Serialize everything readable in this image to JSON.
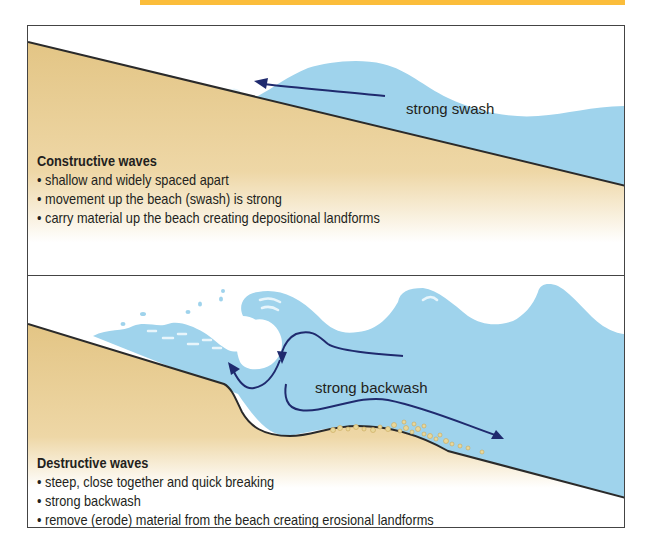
{
  "colors": {
    "header_strip": "#fbbd3b",
    "sand": "#e6cb8e",
    "water": "#9fd3ec",
    "arrow": "#1f2a6e",
    "border": "#444444",
    "text": "#231f20"
  },
  "constructive": {
    "arrow_label": "strong swash",
    "title": "Constructive waves",
    "bullets": [
      "shallow and widely spaced apart",
      "movement up the beach (swash) is strong",
      "carry material up the beach creating depositional landforms"
    ]
  },
  "destructive": {
    "arrow_label": "strong backwash",
    "title": "Destructive waves",
    "bullets": [
      "steep, close together and quick breaking",
      "strong backwash",
      "remove (erode) material from the beach creating erosional landforms"
    ]
  }
}
